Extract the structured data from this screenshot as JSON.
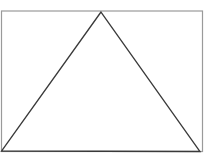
{
  "diagram": {
    "rectangle": {
      "x": 1.5,
      "y": 11,
      "width": 201,
      "height": 140.5,
      "stroke": "#9a9a9a"
    },
    "triangle": {
      "points": [
        [
          101,
          12
        ],
        [
          1.5,
          151
        ],
        [
          200,
          151.5
        ]
      ],
      "stroke": "#3a3a3a"
    },
    "labels": []
  }
}
